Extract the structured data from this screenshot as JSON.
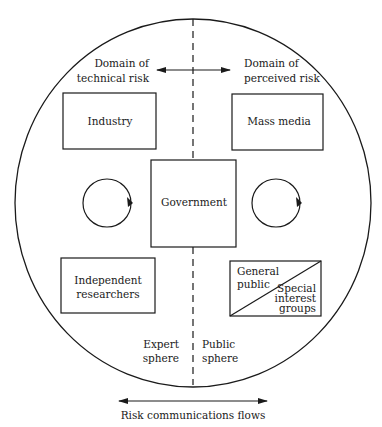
{
  "diagram": {
    "top_arrow": {
      "left_label_line1": "Domain of",
      "left_label_line2": "technical risk",
      "right_label_line1": "Domain of",
      "right_label_line2": "perceived risk"
    },
    "boxes": {
      "industry": "Industry",
      "mass_media": "Mass media",
      "government": "Government",
      "independent_line1": "Independent",
      "independent_line2": "researchers",
      "general_line1": "General",
      "general_line2": "public",
      "special_line1": "Special",
      "special_line2": "interest",
      "special_line3": "groups"
    },
    "spheres": {
      "expert_line1": "Expert",
      "expert_line2": "sphere",
      "public_line1": "Public",
      "public_line2": "sphere"
    },
    "bottom_caption": "Risk communications flows",
    "colors": {
      "stroke": "#1a1a1a",
      "background": "#ffffff"
    }
  }
}
